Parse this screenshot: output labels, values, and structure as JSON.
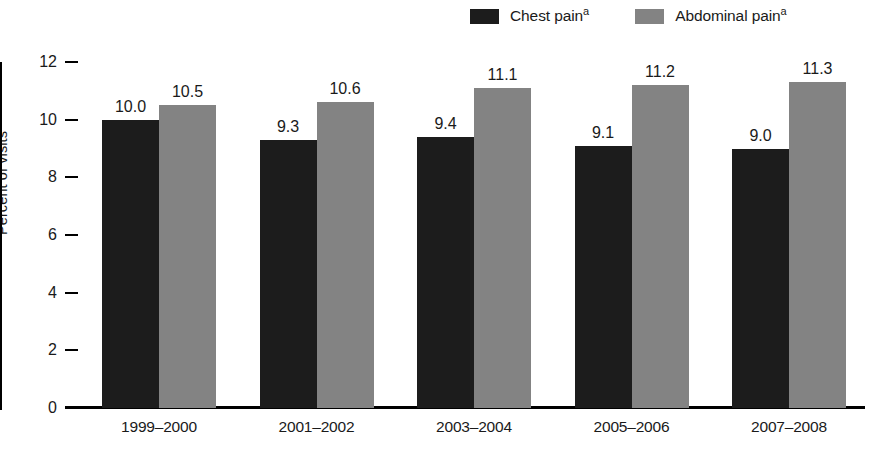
{
  "chart_data": {
    "type": "bar",
    "title": "",
    "subtitle": "",
    "xlabel": "",
    "ylabel": "Percent of visits",
    "categories": [
      "1999–2000",
      "2001–2002",
      "2003–2004",
      "2005–2006",
      "2007–2008"
    ],
    "series": [
      {
        "name": "Chest pain",
        "footnote_mark": "a",
        "color": "#1c1c1c",
        "values": [
          10.0,
          9.3,
          9.4,
          9.1,
          9.0
        ],
        "value_labels": [
          "10.0",
          "9.3",
          "9.4",
          "9.1",
          "9.0"
        ]
      },
      {
        "name": "Abdominal pain",
        "footnote_mark": "a",
        "color": "#838383",
        "values": [
          10.5,
          10.6,
          11.1,
          11.2,
          11.3
        ],
        "value_labels": [
          "10.5",
          "10.6",
          "11.1",
          "11.2",
          "11.3"
        ]
      }
    ],
    "ylim": [
      0,
      12
    ],
    "yticks": [
      0,
      2,
      4,
      6,
      8,
      10,
      12
    ],
    "ytick_labels": [
      "0",
      "2",
      "4",
      "6",
      "8",
      "10",
      "12"
    ],
    "grid": false,
    "legend_position": "top-right",
    "bar_labels_shown": true
  },
  "legend": {
    "entries": [
      {
        "label": "Chest pain",
        "mark": "a",
        "swatch": "series-dark"
      },
      {
        "label": "Abdominal pain",
        "mark": "a",
        "swatch": "series-gray"
      }
    ]
  }
}
